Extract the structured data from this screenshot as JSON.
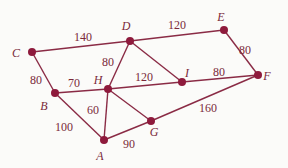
{
  "graph": {
    "nodes": [
      {
        "id": "A",
        "label": "A"
      },
      {
        "id": "B",
        "label": "B"
      },
      {
        "id": "C",
        "label": "C"
      },
      {
        "id": "D",
        "label": "D"
      },
      {
        "id": "E",
        "label": "E"
      },
      {
        "id": "F",
        "label": "F"
      },
      {
        "id": "G",
        "label": "G"
      },
      {
        "id": "H",
        "label": "H"
      },
      {
        "id": "I",
        "label": "I"
      }
    ],
    "edges": [
      {
        "from": "C",
        "to": "D",
        "weight": "140"
      },
      {
        "from": "D",
        "to": "E",
        "weight": "120"
      },
      {
        "from": "E",
        "to": "F",
        "weight": "80"
      },
      {
        "from": "C",
        "to": "B",
        "weight": "80"
      },
      {
        "from": "B",
        "to": "H",
        "weight": "70"
      },
      {
        "from": "D",
        "to": "H",
        "weight": "80"
      },
      {
        "from": "D",
        "to": "I",
        "weight": ""
      },
      {
        "from": "H",
        "to": "I",
        "weight": "120"
      },
      {
        "from": "I",
        "to": "F",
        "weight": "80"
      },
      {
        "from": "B",
        "to": "A",
        "weight": "100"
      },
      {
        "from": "H",
        "to": "A",
        "weight": "60"
      },
      {
        "from": "H",
        "to": "G",
        "weight": ""
      },
      {
        "from": "A",
        "to": "G",
        "weight": "90"
      },
      {
        "from": "G",
        "to": "F",
        "weight": "160"
      }
    ]
  }
}
